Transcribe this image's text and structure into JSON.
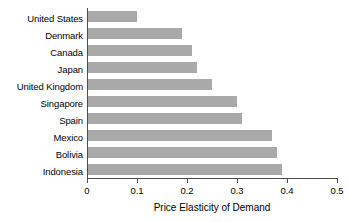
{
  "chart_data": {
    "type": "bar",
    "orientation": "horizontal",
    "title": "",
    "xlabel": "Price Elasticity of Demand",
    "ylabel": "",
    "xlim": [
      0,
      0.5
    ],
    "xticks": [
      "0",
      "0.1",
      "0.2",
      "0.3",
      "0.4",
      "0.5"
    ],
    "xtick_values": [
      0,
      0.1,
      0.2,
      0.3,
      0.4,
      0.5
    ],
    "grid": false,
    "legend": null,
    "bar_color": "#a9a9a9",
    "axis_color": "#4d4d4d",
    "categories": [
      "United States",
      "Denmark",
      "Canada",
      "Japan",
      "United Kingdom",
      "Singapore",
      "Spain",
      "Mexico",
      "Bolivia",
      "Indonesia"
    ],
    "values": [
      0.1,
      0.19,
      0.21,
      0.22,
      0.25,
      0.3,
      0.31,
      0.37,
      0.38,
      0.39
    ]
  }
}
